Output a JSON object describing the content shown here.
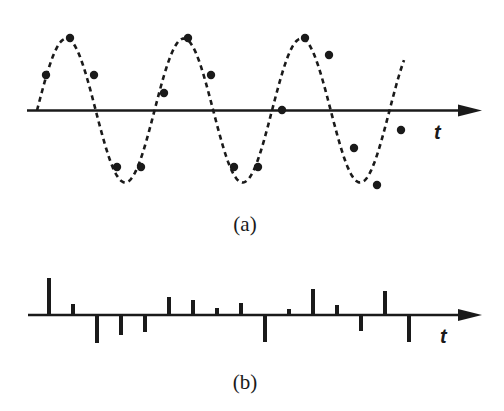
{
  "figure": {
    "panel_a": {
      "caption": "(a)",
      "axis_label": "t",
      "axis": {
        "y": 110.5,
        "x_start": 27,
        "x_end": 482
      },
      "signal": {
        "type": "sine",
        "x_start": 37,
        "x_end": 404,
        "period": 117.5,
        "amplitude": 72,
        "phase_zero_x": 37,
        "style": "dashed"
      },
      "samples": [
        {
          "x": 46,
          "y": 75
        },
        {
          "x": 70,
          "y": 38
        },
        {
          "x": 94,
          "y": 75
        },
        {
          "x": 117,
          "y": 167
        },
        {
          "x": 141,
          "y": 167
        },
        {
          "x": 164,
          "y": 93
        },
        {
          "x": 188,
          "y": 38
        },
        {
          "x": 211,
          "y": 75
        },
        {
          "x": 234,
          "y": 167
        },
        {
          "x": 258,
          "y": 167
        },
        {
          "x": 282,
          "y": 110
        },
        {
          "x": 305,
          "y": 38
        },
        {
          "x": 329,
          "y": 55
        },
        {
          "x": 354,
          "y": 148
        },
        {
          "x": 377,
          "y": 185
        },
        {
          "x": 401,
          "y": 130
        }
      ]
    },
    "panel_b": {
      "caption": "(b)",
      "axis_label": "t",
      "axis": {
        "y": 315,
        "x_start": 28,
        "x_end": 482
      },
      "bars": [
        {
          "x": 49,
          "h": 37
        },
        {
          "x": 73,
          "h": 11
        },
        {
          "x": 97,
          "h": -28
        },
        {
          "x": 121,
          "h": -20
        },
        {
          "x": 145,
          "h": -17
        },
        {
          "x": 169,
          "h": 18
        },
        {
          "x": 193,
          "h": 15
        },
        {
          "x": 217,
          "h": 7
        },
        {
          "x": 241,
          "h": 12
        },
        {
          "x": 265,
          "h": -27
        },
        {
          "x": 289,
          "h": 6
        },
        {
          "x": 313,
          "h": 26
        },
        {
          "x": 337,
          "h": 10
        },
        {
          "x": 361,
          "h": -16
        },
        {
          "x": 385,
          "h": 24
        },
        {
          "x": 409,
          "h": -27
        }
      ]
    },
    "colors": {
      "ink": "#1a1a1a",
      "background": "#ffffff"
    }
  }
}
